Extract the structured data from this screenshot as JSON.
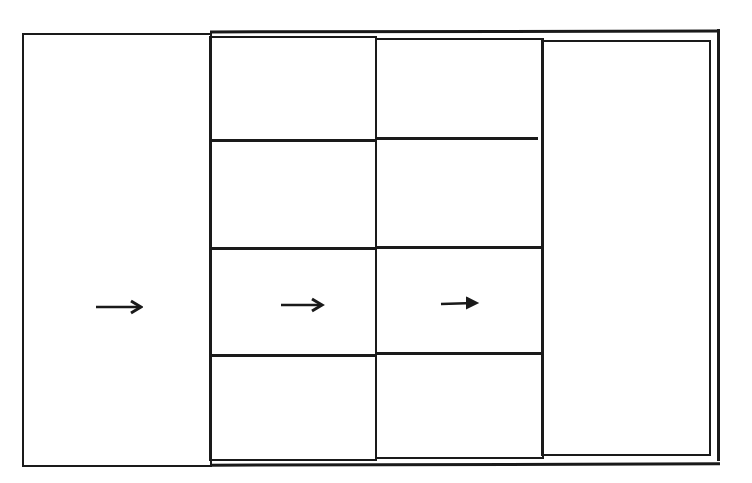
{
  "diagram": {
    "kind": "hand-drawn wireframe",
    "stroke_color": "#1a1a1a",
    "background_color": "#ffffff",
    "columns": [
      {
        "name": "column-1",
        "rows": 1,
        "arrow": "right-arrow",
        "arrow_row": 1
      },
      {
        "name": "column-2",
        "rows": 4,
        "arrow": "right-arrow",
        "arrow_row": 3
      },
      {
        "name": "column-3",
        "rows": 4,
        "arrow": "right-arrow",
        "arrow_row": 3
      },
      {
        "name": "column-4",
        "rows": 1,
        "arrow": null
      }
    ],
    "arrows": [
      {
        "icon": "right-arrow-icon",
        "glyph": "→"
      },
      {
        "icon": "right-arrow-icon",
        "glyph": "→"
      },
      {
        "icon": "right-arrow-icon",
        "glyph": "→"
      }
    ]
  }
}
